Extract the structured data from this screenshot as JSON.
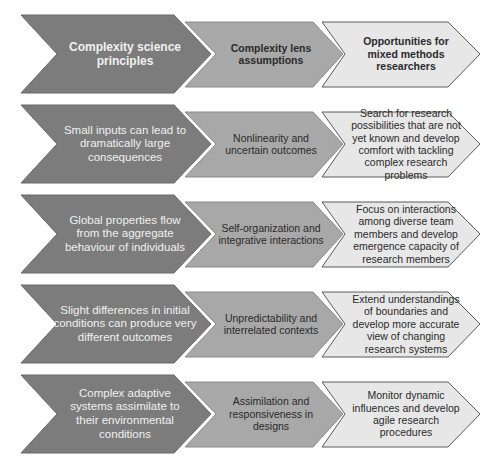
{
  "colors": {
    "principle_fill": "#7c7c7c",
    "assumption_fill": "#a8a8a8",
    "opportunity_fill": "#e7e7e7",
    "outline": "#5a5a5a"
  },
  "header": {
    "principle": "Complexity science principles",
    "assumption": "Complexity lens assumptions",
    "opportunity": "Opportunities for mixed methods researchers"
  },
  "rows": [
    {
      "principle": "Small inputs can lead to dramatically large consequences",
      "assumption": "Nonlinearity and uncertain outcomes",
      "opportunity": "Search for research possibilities that are not yet known and develop comfort with tackling complex research problems"
    },
    {
      "principle": "Global properties flow from the aggregate behaviour of individuals",
      "assumption": "Self-organization and integrative interactions",
      "opportunity": "Focus on interactions among diverse team members and develop emergence capacity of research members"
    },
    {
      "principle": "Slight differences in initial conditions can produce very different outcomes",
      "assumption": "Unpredictability and interrelated contexts",
      "opportunity": "Extend understandings of boundaries and develop more accurate view of changing research systems"
    },
    {
      "principle": "Complex adaptive systems assimilate to their environmental conditions",
      "assumption": "Assimilation and responsiveness in designs",
      "opportunity": "Monitor dynamic influences and develop agile research procedures"
    }
  ]
}
